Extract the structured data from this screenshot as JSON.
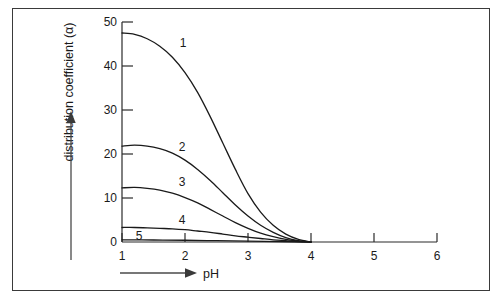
{
  "chart_data": {
    "type": "line",
    "title": "",
    "xlabel": "pH",
    "ylabel": "distribution coefficient (α)",
    "xlim": [
      1,
      6
    ],
    "ylim": [
      0,
      50
    ],
    "xticks": [
      "1",
      "2",
      "3",
      "4",
      "5",
      "6"
    ],
    "yticks": [
      "0",
      "10",
      "20",
      "30",
      "40",
      "50"
    ],
    "grid": false,
    "legend": "inline curve labels",
    "series": [
      {
        "name": "1",
        "label": "1",
        "x": [
          1.0,
          1.2,
          1.4,
          1.6,
          1.8,
          2.0,
          2.2,
          2.4,
          2.6,
          2.8,
          3.0,
          3.2,
          3.4,
          3.6,
          3.8,
          4.0
        ],
        "values": [
          47.5,
          47.2,
          46.2,
          44.5,
          42.0,
          38.5,
          34.0,
          28.5,
          22.5,
          16.5,
          11.0,
          6.8,
          3.8,
          1.8,
          0.6,
          0.0
        ]
      },
      {
        "name": "2",
        "label": "2",
        "x": [
          1.0,
          1.2,
          1.4,
          1.6,
          1.8,
          2.0,
          2.2,
          2.4,
          2.6,
          2.8,
          3.0,
          3.2,
          3.4,
          3.6,
          3.8,
          4.0
        ],
        "values": [
          21.8,
          22.0,
          21.8,
          21.2,
          20.2,
          18.6,
          16.5,
          14.0,
          11.2,
          8.4,
          5.9,
          3.8,
          2.2,
          1.0,
          0.3,
          0.0
        ]
      },
      {
        "name": "3",
        "label": "3",
        "x": [
          1.0,
          1.2,
          1.4,
          1.6,
          1.8,
          2.0,
          2.2,
          2.4,
          2.6,
          2.8,
          3.0,
          3.2,
          3.4,
          3.6,
          3.8,
          4.0
        ],
        "values": [
          12.3,
          12.4,
          12.2,
          11.8,
          11.1,
          10.1,
          8.9,
          7.4,
          5.9,
          4.4,
          3.1,
          2.0,
          1.2,
          0.6,
          0.2,
          0.0
        ]
      },
      {
        "name": "4",
        "label": "4",
        "x": [
          1.0,
          1.2,
          1.4,
          1.6,
          1.8,
          2.0,
          2.2,
          2.4,
          2.6,
          2.8,
          3.0,
          3.2,
          3.4,
          3.6,
          3.8,
          4.0
        ],
        "values": [
          3.3,
          3.3,
          3.2,
          3.1,
          3.0,
          2.8,
          2.5,
          2.2,
          1.8,
          1.4,
          1.1,
          0.8,
          0.5,
          0.3,
          0.1,
          0.0
        ]
      },
      {
        "name": "5",
        "label": "5",
        "x": [
          1.0,
          1.5,
          2.0,
          2.5,
          3.0,
          3.5,
          4.0
        ],
        "values": [
          0.5,
          0.45,
          0.4,
          0.3,
          0.2,
          0.1,
          0.0
        ]
      }
    ]
  },
  "axes": {
    "y_axis_title": "distribution coefficient (α)",
    "x_axis_title": "pH",
    "y_tick_labels": [
      "50",
      "40",
      "30",
      "20",
      "10",
      "0"
    ],
    "x_tick_labels": [
      "1",
      "2",
      "3",
      "4",
      "5",
      "6"
    ]
  },
  "curve_labels": {
    "c1": "1",
    "c2": "2",
    "c3": "3",
    "c4": "4",
    "c5": "5"
  }
}
